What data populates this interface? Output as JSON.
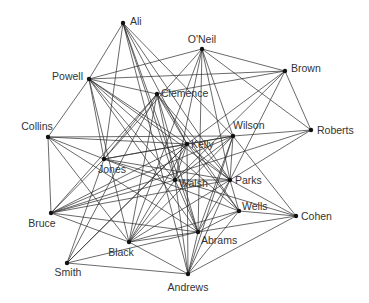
{
  "diagram": {
    "type": "network-graph",
    "nodes": [
      {
        "id": "Ali",
        "label": "Ali",
        "x": 123,
        "y": 23,
        "lx": 130,
        "ly": 25,
        "anchor": "start"
      },
      {
        "id": "ONeil",
        "label": "O'Neil",
        "x": 202,
        "y": 49,
        "lx": 202,
        "ly": 43,
        "anchor": "middle"
      },
      {
        "id": "Brown",
        "label": "Brown",
        "x": 285,
        "y": 71,
        "lx": 291,
        "ly": 72,
        "anchor": "start"
      },
      {
        "id": "Powell",
        "label": "Powell",
        "x": 89,
        "y": 79,
        "lx": 83,
        "ly": 80,
        "anchor": "end"
      },
      {
        "id": "Clemence",
        "label": "Clemence",
        "x": 157,
        "y": 94,
        "lx": 161,
        "ly": 97,
        "anchor": "start"
      },
      {
        "id": "Collins",
        "label": "Collins",
        "x": 48,
        "y": 137,
        "lx": 37,
        "ly": 130,
        "anchor": "middle"
      },
      {
        "id": "Roberts",
        "label": "Roberts",
        "x": 311,
        "y": 130,
        "lx": 317,
        "ly": 134,
        "anchor": "start"
      },
      {
        "id": "Wilson",
        "label": "Wilson",
        "x": 233,
        "y": 136,
        "lx": 233,
        "ly": 129,
        "anchor": "start"
      },
      {
        "id": "Kelly",
        "label": "Kelly",
        "x": 187,
        "y": 144,
        "lx": 191,
        "ly": 148,
        "anchor": "start"
      },
      {
        "id": "Jones",
        "label": "Jones",
        "x": 104,
        "y": 159,
        "lx": 112,
        "ly": 173,
        "anchor": "middle"
      },
      {
        "id": "Walsh",
        "label": "Walsh",
        "x": 175,
        "y": 180,
        "lx": 179,
        "ly": 187,
        "anchor": "start"
      },
      {
        "id": "Parks",
        "label": "Parks",
        "x": 230,
        "y": 180,
        "lx": 235,
        "ly": 184,
        "anchor": "start"
      },
      {
        "id": "Wells",
        "label": "Wells",
        "x": 239,
        "y": 211,
        "lx": 242,
        "ly": 210,
        "anchor": "start"
      },
      {
        "id": "Cohen",
        "label": "Cohen",
        "x": 296,
        "y": 216,
        "lx": 301,
        "ly": 220,
        "anchor": "start"
      },
      {
        "id": "Bruce",
        "label": "Bruce",
        "x": 51,
        "y": 213,
        "lx": 42,
        "ly": 227,
        "anchor": "middle"
      },
      {
        "id": "Abrams",
        "label": "Abrams",
        "x": 198,
        "y": 232,
        "lx": 201,
        "ly": 244,
        "anchor": "start"
      },
      {
        "id": "Black",
        "label": "Black",
        "x": 129,
        "y": 242,
        "lx": 121,
        "ly": 256,
        "anchor": "middle"
      },
      {
        "id": "Smith",
        "label": "Smith",
        "x": 67,
        "y": 263,
        "lx": 68,
        "ly": 276,
        "anchor": "middle"
      },
      {
        "id": "Andrews",
        "label": "Andrews",
        "x": 188,
        "y": 274,
        "lx": 188,
        "ly": 291,
        "anchor": "middle"
      }
    ],
    "edges": [
      [
        "Ali",
        "Powell"
      ],
      [
        "Ali",
        "Jones"
      ],
      [
        "Ali",
        "Walsh"
      ],
      [
        "Ali",
        "Kelly"
      ],
      [
        "Ali",
        "Abrams"
      ],
      [
        "Ali",
        "Parks"
      ],
      [
        "Ali",
        "Wilson"
      ],
      [
        "Ali",
        "Andrews"
      ],
      [
        "ONeil",
        "Brown"
      ],
      [
        "ONeil",
        "Roberts"
      ],
      [
        "ONeil",
        "Powell"
      ],
      [
        "ONeil",
        "Wilson"
      ],
      [
        "ONeil",
        "Walsh"
      ],
      [
        "ONeil",
        "Parks"
      ],
      [
        "ONeil",
        "Black"
      ],
      [
        "ONeil",
        "Abrams"
      ],
      [
        "ONeil",
        "Jones"
      ],
      [
        "Brown",
        "Powell"
      ],
      [
        "Brown",
        "Clemence"
      ],
      [
        "Brown",
        "Roberts"
      ],
      [
        "Brown",
        "Kelly"
      ],
      [
        "Brown",
        "Parks"
      ],
      [
        "Brown",
        "Walsh"
      ],
      [
        "Powell",
        "Collins"
      ],
      [
        "Powell",
        "Clemence"
      ],
      [
        "Powell",
        "Kelly"
      ],
      [
        "Powell",
        "Walsh"
      ],
      [
        "Powell",
        "Parks"
      ],
      [
        "Powell",
        "Wells"
      ],
      [
        "Powell",
        "Black"
      ],
      [
        "Powell",
        "Abrams"
      ],
      [
        "Powell",
        "Jones"
      ],
      [
        "Clemence",
        "Kelly"
      ],
      [
        "Clemence",
        "Walsh"
      ],
      [
        "Clemence",
        "Parks"
      ],
      [
        "Clemence",
        "Bruce"
      ],
      [
        "Clemence",
        "Black"
      ],
      [
        "Clemence",
        "Smith"
      ],
      [
        "Clemence",
        "Wells"
      ],
      [
        "Clemence",
        "Abrams"
      ],
      [
        "Clemence",
        "Jones"
      ],
      [
        "Collins",
        "Bruce"
      ],
      [
        "Collins",
        "Wilson"
      ],
      [
        "Collins",
        "Kelly"
      ],
      [
        "Collins",
        "Jones"
      ],
      [
        "Collins",
        "Abrams"
      ],
      [
        "Collins",
        "Black"
      ],
      [
        "Roberts",
        "Wilson"
      ],
      [
        "Roberts",
        "Parks"
      ],
      [
        "Roberts",
        "Bruce"
      ],
      [
        "Wilson",
        "Kelly"
      ],
      [
        "Wilson",
        "Parks"
      ],
      [
        "Wilson",
        "Walsh"
      ],
      [
        "Wilson",
        "Jones"
      ],
      [
        "Wilson",
        "Cohen"
      ],
      [
        "Wilson",
        "Abrams"
      ],
      [
        "Wilson",
        "Black"
      ],
      [
        "Wilson",
        "Bruce"
      ],
      [
        "Wilson",
        "Andrews"
      ],
      [
        "Kelly",
        "Walsh"
      ],
      [
        "Kelly",
        "Parks"
      ],
      [
        "Kelly",
        "Jones"
      ],
      [
        "Kelly",
        "Bruce"
      ],
      [
        "Kelly",
        "Black"
      ],
      [
        "Kelly",
        "Wells"
      ],
      [
        "Kelly",
        "Andrews"
      ],
      [
        "Kelly",
        "Smith"
      ],
      [
        "Jones",
        "Walsh"
      ],
      [
        "Jones",
        "Parks"
      ],
      [
        "Jones",
        "Wells"
      ],
      [
        "Jones",
        "Smith"
      ],
      [
        "Jones",
        "Bruce"
      ],
      [
        "Walsh",
        "Parks"
      ],
      [
        "Walsh",
        "Cohen"
      ],
      [
        "Walsh",
        "Abrams"
      ],
      [
        "Walsh",
        "Andrews"
      ],
      [
        "Walsh",
        "Bruce"
      ],
      [
        "Walsh",
        "Black"
      ],
      [
        "Parks",
        "Wells"
      ],
      [
        "Parks",
        "Cohen"
      ],
      [
        "Parks",
        "Abrams"
      ],
      [
        "Parks",
        "Black"
      ],
      [
        "Parks",
        "Bruce"
      ],
      [
        "Parks",
        "Andrews"
      ],
      [
        "Wells",
        "Cohen"
      ],
      [
        "Wells",
        "Abrams"
      ],
      [
        "Wells",
        "Black"
      ],
      [
        "Wells",
        "Andrews"
      ],
      [
        "Cohen",
        "Abrams"
      ],
      [
        "Cohen",
        "Andrews"
      ],
      [
        "Bruce",
        "Abrams"
      ],
      [
        "Bruce",
        "Black"
      ],
      [
        "Abrams",
        "Black"
      ],
      [
        "Abrams",
        "Andrews"
      ],
      [
        "Abrams",
        "Smith"
      ],
      [
        "Black",
        "Andrews"
      ],
      [
        "Smith",
        "Andrews"
      ],
      [
        "Smith",
        "Kelly"
      ]
    ]
  }
}
